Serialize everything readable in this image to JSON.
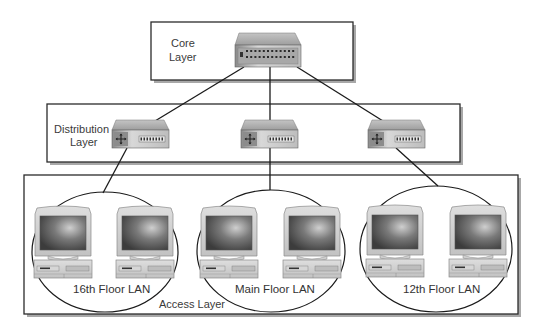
{
  "colors": {
    "line": "#1a1a1a",
    "box_border": "#2b2b2b",
    "box_shadow": "#9a9a9a",
    "device_body": "#c8c8c8",
    "device_top": "#b0b0b0",
    "screen": "#555555",
    "text": "#3a3a3a"
  },
  "layers": {
    "core": {
      "line1": "Core",
      "line2": "Layer"
    },
    "distribution": {
      "line1": "Distribution",
      "line2": "Layer"
    },
    "access": {
      "label": "Access Layer"
    }
  },
  "devices": {
    "core_switch": {
      "name": "core switch"
    },
    "distribution_switches": [
      {
        "name": "distribution switch 1"
      },
      {
        "name": "distribution switch 2"
      },
      {
        "name": "distribution switch 3"
      }
    ]
  },
  "lans": [
    {
      "label": "16th Floor LAN",
      "computers": 2
    },
    {
      "label": "Main Floor LAN",
      "computers": 2
    },
    {
      "label": "12th Floor LAN",
      "computers": 2
    }
  ]
}
